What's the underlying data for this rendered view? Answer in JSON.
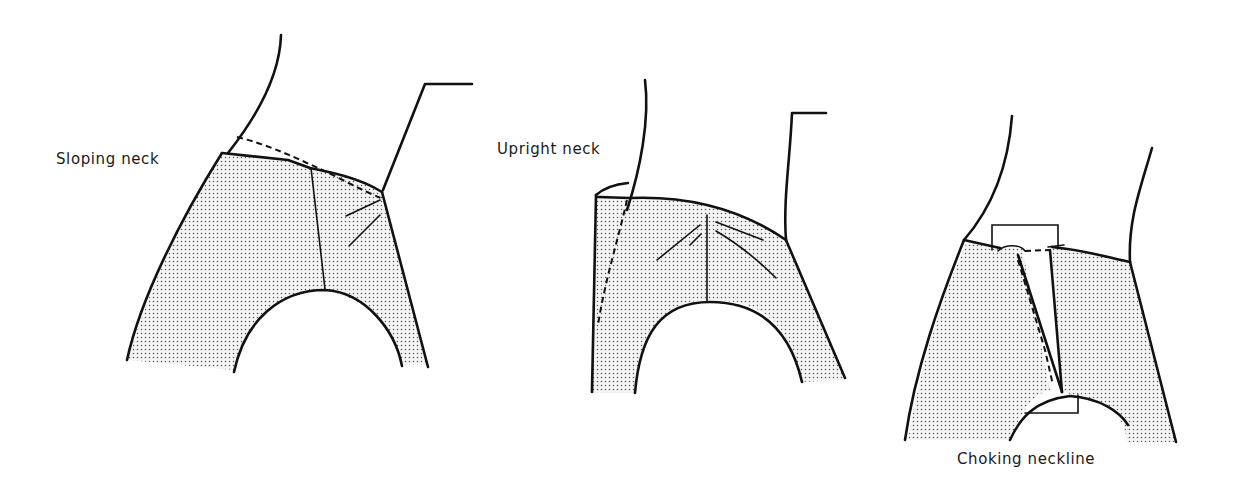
{
  "figure": {
    "type": "garment-fitting-illustration",
    "panels": [
      {
        "id": "sloping",
        "label": "Sloping neck"
      },
      {
        "id": "upright",
        "label": "Upright neck"
      },
      {
        "id": "choking",
        "label": "Choking neckline"
      }
    ],
    "colors": {
      "line": "#111111",
      "fabric_dots": "#555555",
      "background": "#ffffff"
    }
  }
}
